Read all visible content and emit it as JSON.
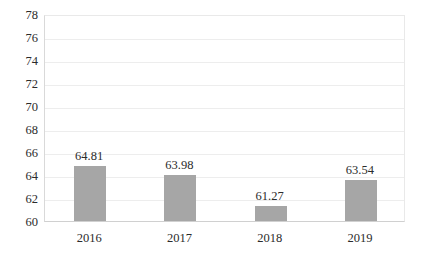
{
  "chart_data": {
    "type": "bar",
    "title": "",
    "xlabel": "",
    "ylabel": "",
    "categories": [
      "2016",
      "2017",
      "2018",
      "2019"
    ],
    "values": [
      64.81,
      63.98,
      61.27,
      63.54
    ],
    "value_labels": [
      "64.81",
      "63.98",
      "61.27",
      "63.54"
    ],
    "ylim": [
      60,
      78
    ],
    "yticks": [
      78,
      76,
      74,
      72,
      70,
      68,
      66,
      64,
      62,
      60
    ],
    "ytick_labels": [
      "78",
      "76",
      "74",
      "72",
      "70",
      "68",
      "66",
      "64",
      "62",
      "60"
    ],
    "grid": true,
    "grid_axis": "y",
    "legend": false,
    "legend_position": "none",
    "bar_color": "#a6a6a6",
    "gridline_color": "#ededed",
    "axis_color": "#d9d9d9",
    "text_color": "#2b2b2b",
    "background_color": "#ffffff"
  }
}
